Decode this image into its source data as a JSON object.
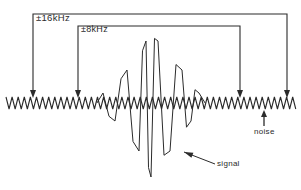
{
  "figure": {
    "width": 301,
    "height": 190,
    "background_color": "#ffffff",
    "ink_color": "#2b2b2b"
  },
  "annotations": {
    "outer_bracket_label": "±16kHz",
    "inner_bracket_label": "±8kHz",
    "noise_label": "noise",
    "signal_label": "signal"
  },
  "chart_data": {
    "type": "line",
    "title": "",
    "subtitle": "",
    "xlabel": "",
    "ylabel": "",
    "grid": false,
    "legend_position": "none",
    "axis_visible": false,
    "baseline_y_px": 103,
    "xlim_px": [
      6,
      296
    ],
    "ylim_px": [
      28,
      186
    ],
    "series": [
      {
        "name": "noise",
        "description": "Dense low-amplitude zigzag noise floor spanning the full width",
        "waveform": "triangle",
        "amplitude_px": 6,
        "half_period_px": 3.05,
        "x_start_px": 6,
        "x_end_px": 296,
        "color": "#2b2b2b",
        "line_width": 1.1
      },
      {
        "name": "signal",
        "description": "Amplitude-modulated sinc-like burst centred on the spectrum, overlaid on the noise floor",
        "waveform": "triangle",
        "half_period_px": 6.1,
        "x_start_px": 100,
        "x_end_px": 202,
        "center_px": 151,
        "color": "#2b2b2b",
        "line_width": 1.0,
        "peak_envelope_px": [
          10,
          18,
          33,
          48,
          62,
          74,
          62,
          48,
          33,
          18,
          10
        ],
        "peak_x_px": [
          103,
          115,
          127,
          139,
          146,
          151,
          158,
          170,
          182,
          191,
          199
        ]
      }
    ],
    "markers": [
      {
        "name": "outer-bracket",
        "label": "±16kHz",
        "kind": "bracket-with-down-arrows",
        "top_y_px": 14,
        "left_x_px": 33,
        "right_x_px": 287,
        "arrow_tip_y_px": 98
      },
      {
        "name": "inner-bracket",
        "label": "±8kHz",
        "kind": "bracket-with-down-arrows",
        "top_y_px": 26,
        "left_x_px": 78,
        "right_x_px": 240,
        "arrow_tip_y_px": 98
      },
      {
        "name": "noise-pointer",
        "label": "noise",
        "kind": "up-arrow",
        "x_px": 264,
        "tail_y_px": 126,
        "tip_y_px": 110
      },
      {
        "name": "signal-pointer",
        "label": "signal",
        "kind": "diagonal-arrow",
        "tail_x_px": 215,
        "tail_y_px": 164,
        "tip_x_px": 184,
        "tip_y_px": 152
      }
    ]
  }
}
